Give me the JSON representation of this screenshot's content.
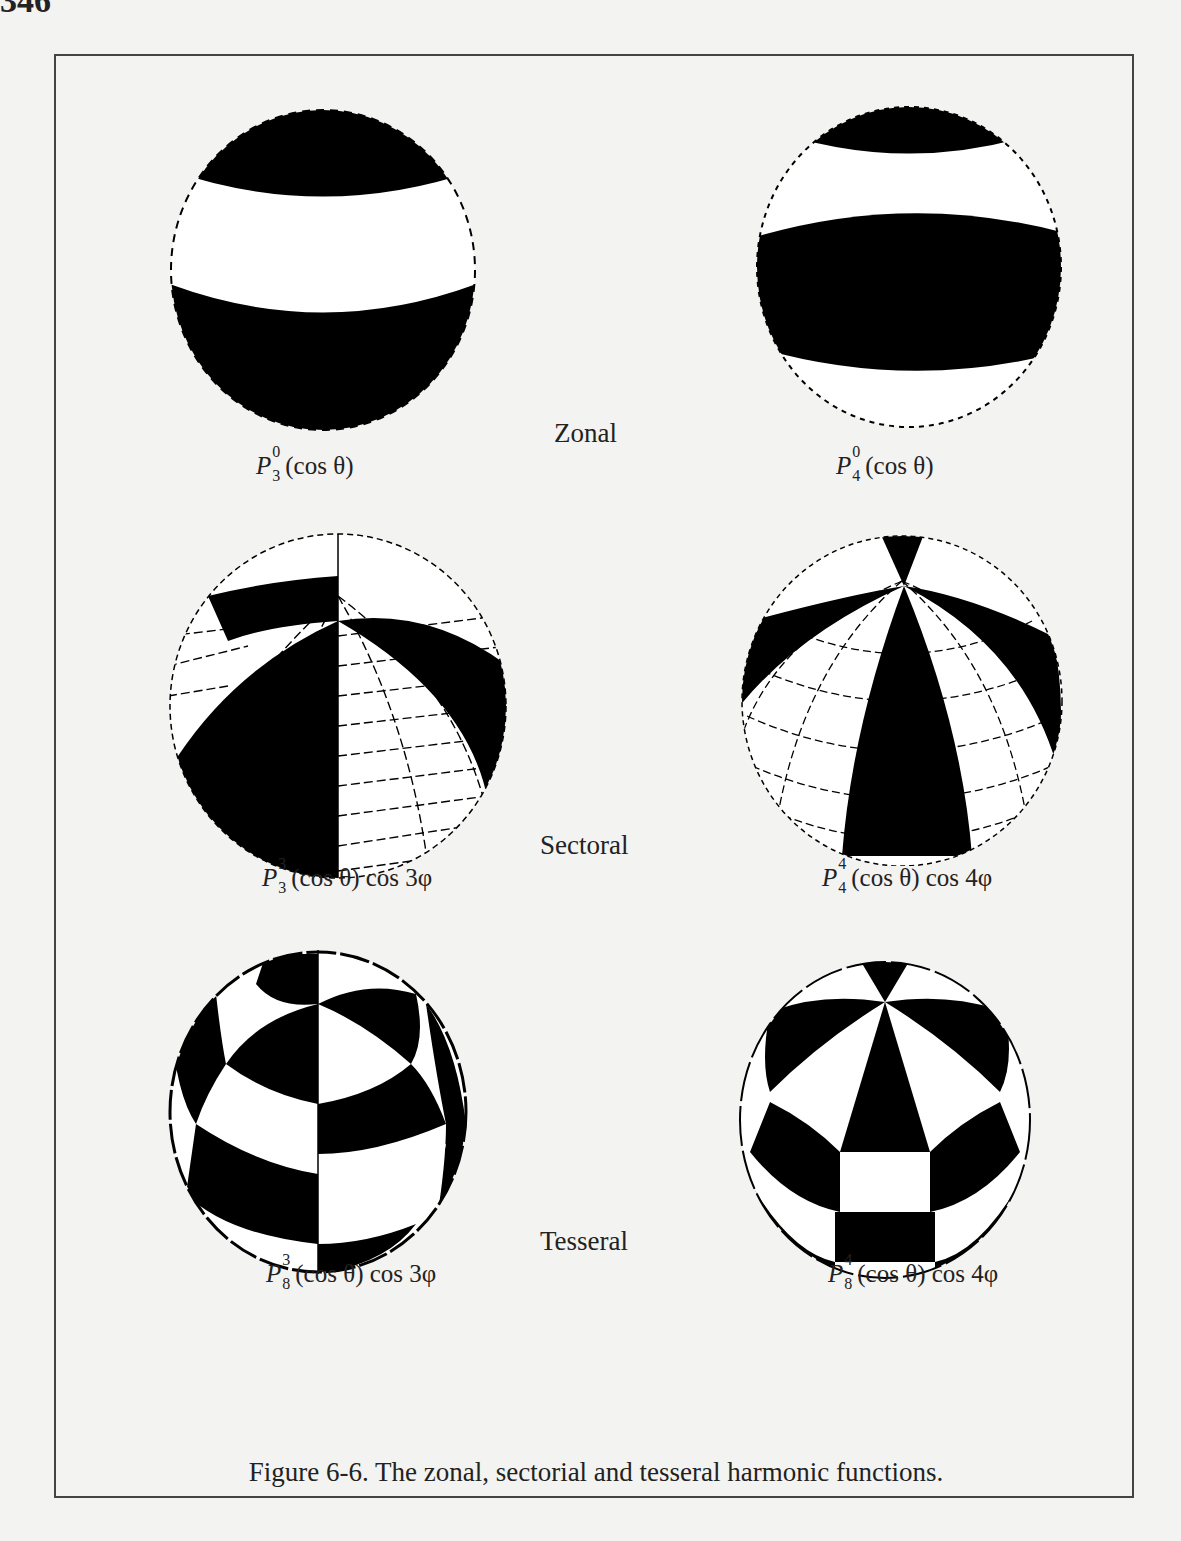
{
  "page": {
    "page_number": "346"
  },
  "figure": {
    "caption": "Figure 6-6. The zonal, sectorial and tesseral harmonic functions.",
    "rows": [
      {
        "category": "Zonal",
        "left": {
          "P": "P",
          "upper": "0",
          "lower": "3",
          "args": "(cos θ)",
          "extra": ""
        },
        "right": {
          "P": "P",
          "upper": "0",
          "lower": "4",
          "args": "(cos θ)",
          "extra": ""
        }
      },
      {
        "category": "Sectoral",
        "left": {
          "P": "P",
          "upper": "3",
          "lower": "3",
          "args": "(cos θ)",
          "extra": " cos 3φ"
        },
        "right": {
          "P": "P",
          "upper": "4",
          "lower": "4",
          "args": "(cos θ)",
          "extra": " cos 4φ"
        }
      },
      {
        "category": "Tesseral",
        "left": {
          "P": "P",
          "upper": "3",
          "lower": "8",
          "args": "(cos θ)",
          "extra": " cos 3φ"
        },
        "right": {
          "P": "P",
          "upper": "4",
          "lower": "8",
          "args": "(cos θ)",
          "extra": " cos 4φ"
        }
      }
    ]
  },
  "colors": {
    "paper": "#f3f3f1",
    "ink": "#000000",
    "frame": "#444444"
  }
}
